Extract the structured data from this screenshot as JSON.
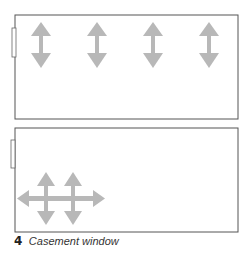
{
  "figure": {
    "number": "4",
    "caption": "Casement window",
    "colors": {
      "frame": "#555555",
      "arrow": "#b8b8b8",
      "background": "#ffffff"
    },
    "panels": [
      {
        "name": "top-window",
        "arrows": [
          "vertical-double-arrow",
          "vertical-double-arrow",
          "vertical-double-arrow",
          "vertical-double-arrow"
        ]
      },
      {
        "name": "bottom-window",
        "arrows": [
          "four-way-arrow",
          "four-way-arrow"
        ]
      }
    ]
  }
}
